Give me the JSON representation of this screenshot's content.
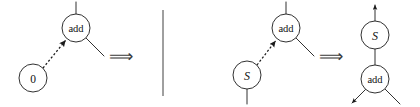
{
  "figure": {
    "background_color": "#ffffff",
    "stroke_color": "#1a1a1a",
    "width": 420,
    "height": 107
  },
  "symbols": {
    "rewrite_arrow": "⟹",
    "divider": "vertical-rule"
  },
  "rules": [
    {
      "id": "rule-zero",
      "lhs": {
        "nodes": [
          {
            "id": "lhs0-add",
            "label": "add",
            "cx": 76,
            "cy": 28,
            "r": 14,
            "label_class": "label-add"
          },
          {
            "id": "lhs0-zero",
            "label": "0",
            "cx": 33,
            "cy": 78,
            "r": 14,
            "label_class": "label-zero"
          }
        ],
        "edges": [
          {
            "id": "lhs0-root-stub",
            "type": "line",
            "x1": 76,
            "y1": 14,
            "x2": 76,
            "y2": 2
          },
          {
            "id": "lhs0-right-arg",
            "type": "line",
            "x1": 86,
            "y1": 38,
            "x2": 104,
            "y2": 56
          },
          {
            "id": "lhs0-redirect",
            "type": "dashed-arrow",
            "x1": 43,
            "y1": 68,
            "x2": 66,
            "y2": 40
          }
        ]
      },
      "rhs": {
        "nodes": [],
        "edges": [
          {
            "id": "rhs0-empty-stub",
            "type": "line",
            "x1": 163,
            "y1": 10,
            "x2": 163,
            "y2": 96
          }
        ]
      },
      "arrow_x": 121,
      "arrow_y": 55
    },
    {
      "id": "rule-successor",
      "lhs": {
        "nodes": [
          {
            "id": "lhs1-add",
            "label": "add",
            "cx": 286,
            "cy": 28,
            "r": 14,
            "label_class": "label-add"
          },
          {
            "id": "lhs1-s",
            "label": "S",
            "cx": 247,
            "cy": 75,
            "r": 14,
            "label_class": "label-s"
          }
        ],
        "edges": [
          {
            "id": "lhs1-root-stub",
            "type": "line",
            "x1": 286,
            "y1": 14,
            "x2": 286,
            "y2": 2
          },
          {
            "id": "lhs1-right-arg",
            "type": "line",
            "x1": 296,
            "y1": 38,
            "x2": 314,
            "y2": 56
          },
          {
            "id": "lhs1-s-child",
            "type": "line",
            "x1": 247,
            "y1": 89,
            "x2": 247,
            "y2": 104
          },
          {
            "id": "lhs1-redirect",
            "type": "dashed-arrow",
            "x1": 257,
            "y1": 65,
            "x2": 276,
            "y2": 40
          }
        ]
      },
      "rhs": {
        "nodes": [
          {
            "id": "rhs1-s",
            "label": "S",
            "cx": 375,
            "cy": 35,
            "r": 14,
            "label_class": "label-s"
          },
          {
            "id": "rhs1-add",
            "label": "add",
            "cx": 375,
            "cy": 79,
            "r": 14,
            "label_class": "label-add"
          }
        ],
        "edges": [
          {
            "id": "rhs1-root-out",
            "type": "arrow",
            "x1": 375,
            "y1": 21,
            "x2": 375,
            "y2": 4
          },
          {
            "id": "rhs1-s-to-add",
            "type": "line",
            "x1": 375,
            "y1": 49,
            "x2": 375,
            "y2": 65
          },
          {
            "id": "rhs1-left-arg",
            "type": "arrow",
            "x1": 366,
            "y1": 89,
            "x2": 351,
            "y2": 104
          },
          {
            "id": "rhs1-right-arg",
            "type": "line",
            "x1": 385,
            "y1": 89,
            "x2": 400,
            "y2": 104
          }
        ]
      },
      "arrow_x": 331,
      "arrow_y": 55
    }
  ]
}
